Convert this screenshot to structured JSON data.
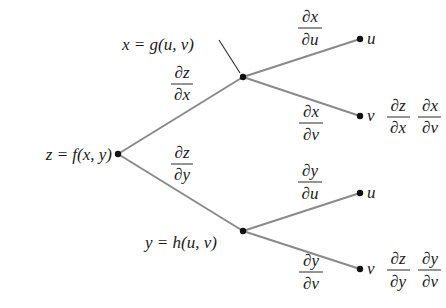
{
  "diagram": {
    "colors": {
      "edge": "#8a8a8a",
      "node": "#111111",
      "text": "#1a1a1a",
      "background": "#ffffff"
    },
    "nodes": {
      "root": {
        "label": "z = f(x, y)",
        "x": 118,
        "y": 154
      },
      "x_node": {
        "label": "x = g(u, v)",
        "x": 243,
        "y": 77
      },
      "y_node": {
        "label": "y = h(u, v)",
        "x": 243,
        "y": 231
      },
      "x_u": {
        "label": "u",
        "x": 360,
        "y": 39
      },
      "x_v": {
        "label": "v",
        "x": 360,
        "y": 116
      },
      "y_u": {
        "label": "u",
        "x": 360,
        "y": 193
      },
      "y_v": {
        "label": "v",
        "x": 360,
        "y": 269
      }
    },
    "edges": [
      {
        "from": "root",
        "to": "x_node",
        "num": "∂z",
        "den": "∂x"
      },
      {
        "from": "root",
        "to": "y_node",
        "num": "∂z",
        "den": "∂y"
      },
      {
        "from": "x_node",
        "to": "x_u",
        "num": "∂x",
        "den": "∂u"
      },
      {
        "from": "x_node",
        "to": "x_v",
        "num": "∂x",
        "den": "∂v"
      },
      {
        "from": "y_node",
        "to": "y_u",
        "num": "∂y",
        "den": "∂u"
      },
      {
        "from": "y_node",
        "to": "y_v",
        "num": "∂y",
        "den": "∂v"
      }
    ],
    "path_products": [
      {
        "leaf": "x_v",
        "factors": [
          {
            "num": "∂z",
            "den": "∂x"
          },
          {
            "num": "∂x",
            "den": "∂v"
          }
        ]
      },
      {
        "leaf": "y_v",
        "factors": [
          {
            "num": "∂z",
            "den": "∂y"
          },
          {
            "num": "∂y",
            "den": "∂v"
          }
        ]
      }
    ]
  }
}
